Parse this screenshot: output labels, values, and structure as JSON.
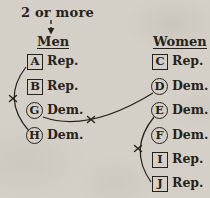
{
  "figure": {
    "annotation": {
      "label": "2 or more",
      "points_to": "Men"
    },
    "columns": {
      "men": {
        "title": "Men",
        "items": [
          {
            "letter": "A",
            "party": "Rep.",
            "shape": "square"
          },
          {
            "letter": "B",
            "party": "Rep.",
            "shape": "square"
          },
          {
            "letter": "G",
            "party": "Dem.",
            "shape": "circle"
          },
          {
            "letter": "H",
            "party": "Dem.",
            "shape": "circle"
          }
        ]
      },
      "women": {
        "title": "Women",
        "items": [
          {
            "letter": "C",
            "party": "Rep.",
            "shape": "square"
          },
          {
            "letter": "D",
            "party": "Dem.",
            "shape": "circle"
          },
          {
            "letter": "E",
            "party": "Dem.",
            "shape": "circle"
          },
          {
            "letter": "F",
            "party": "Dem.",
            "shape": "circle"
          },
          {
            "letter": "I",
            "party": "Rep.",
            "shape": "square"
          },
          {
            "letter": "J",
            "party": "Rep.",
            "shape": "square"
          }
        ]
      }
    },
    "connections": [
      {
        "from": "A",
        "to": "H",
        "crossed_out": true
      },
      {
        "from": "G",
        "to": "D",
        "crossed_out": true
      },
      {
        "from": "E",
        "to": "J",
        "crossed_out": true
      }
    ],
    "colors": {
      "paper": "#d4d0c7",
      "ink": "#26221a"
    }
  }
}
